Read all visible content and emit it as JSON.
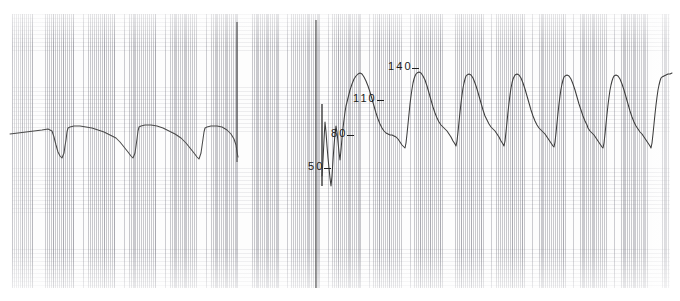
{
  "recording": {
    "kind": "arterial-pressure-strip-chart",
    "units": "mmHg",
    "paper_color": "#fdfdfd",
    "grid_color": "#78788a",
    "trace_color": "#3a3a3a",
    "label_color": "#1b1b1b"
  },
  "scale": {
    "labels": [
      {
        "value": "140",
        "y": 68
      },
      {
        "value": "110",
        "y": 100
      },
      {
        "value": "80",
        "y": 135
      },
      {
        "value": "50",
        "y": 168
      }
    ]
  },
  "chart_data": {
    "type": "line",
    "title": "",
    "subtitle": "",
    "xlabel": "",
    "ylabel": "mmHg",
    "ylim": [
      20,
      160
    ],
    "xlim": [
      0,
      680
    ],
    "grid": true,
    "legend": false,
    "annotations": [
      "140-",
      "110-",
      "80-",
      "50-"
    ],
    "tick_values": [
      50,
      80,
      110,
      140
    ],
    "tick_pixel_y": [
      168,
      135,
      100,
      68
    ],
    "markers": [
      {
        "name": "transition-line",
        "x": 237,
        "y0": 22,
        "y1": 162
      },
      {
        "name": "recalibration-line",
        "x": 316,
        "y0": 20,
        "y1": 288
      },
      {
        "name": "calibration-spike",
        "x": 322,
        "y0": 104,
        "y1": 186
      }
    ],
    "series": [
      {
        "name": "damped-arterial-trace",
        "x_range": [
          10,
          238
        ],
        "mean_pressure": 75,
        "systolic_est": 84,
        "diastolic_est": 66,
        "points": [
          [
            10,
            134
          ],
          [
            18,
            133
          ],
          [
            26,
            132
          ],
          [
            34,
            131
          ],
          [
            42,
            130
          ],
          [
            48,
            129
          ],
          [
            52,
            131
          ],
          [
            54,
            137
          ],
          [
            56,
            145
          ],
          [
            58,
            152
          ],
          [
            60,
            156
          ],
          [
            62,
            158
          ],
          [
            64,
            153
          ],
          [
            65,
            146
          ],
          [
            66,
            140
          ],
          [
            67,
            132
          ],
          [
            68,
            128
          ],
          [
            70,
            127
          ],
          [
            74,
            126
          ],
          [
            80,
            126
          ],
          [
            86,
            127
          ],
          [
            92,
            128
          ],
          [
            98,
            130
          ],
          [
            104,
            132
          ],
          [
            110,
            135
          ],
          [
            116,
            138
          ],
          [
            120,
            142
          ],
          [
            124,
            147
          ],
          [
            128,
            152
          ],
          [
            131,
            156
          ],
          [
            133,
            158
          ],
          [
            135,
            153
          ],
          [
            136,
            146
          ],
          [
            137,
            139
          ],
          [
            138,
            131
          ],
          [
            139,
            127
          ],
          [
            141,
            126
          ],
          [
            145,
            125
          ],
          [
            151,
            125
          ],
          [
            157,
            126
          ],
          [
            163,
            128
          ],
          [
            169,
            131
          ],
          [
            175,
            134
          ],
          [
            181,
            138
          ],
          [
            186,
            143
          ],
          [
            190,
            148
          ],
          [
            194,
            153
          ],
          [
            197,
            157
          ],
          [
            199,
            159
          ],
          [
            201,
            153
          ],
          [
            202,
            146
          ],
          [
            203,
            139
          ],
          [
            204,
            132
          ],
          [
            205,
            128
          ],
          [
            207,
            127
          ],
          [
            211,
            126
          ],
          [
            217,
            126
          ],
          [
            222,
            127
          ],
          [
            227,
            130
          ],
          [
            231,
            134
          ],
          [
            234,
            139
          ],
          [
            236,
            145
          ],
          [
            237,
            152
          ],
          [
            238,
            157
          ]
        ]
      },
      {
        "name": "arterial-pressure-trace",
        "x_range": [
          322,
          672
        ],
        "systolic_est": 136,
        "diastolic_est": 72,
        "beats": 8,
        "points": [
          [
            322,
            176
          ],
          [
            323,
            160
          ],
          [
            324,
            140
          ],
          [
            325,
            122
          ],
          [
            326,
            132
          ],
          [
            327,
            146
          ],
          [
            328,
            158
          ],
          [
            329,
            168
          ],
          [
            330,
            178
          ],
          [
            331,
            186
          ],
          [
            332,
            176
          ],
          [
            333,
            160
          ],
          [
            334,
            146
          ],
          [
            335,
            134
          ],
          [
            336,
            126
          ],
          [
            337,
            132
          ],
          [
            338,
            142
          ],
          [
            339,
            152
          ],
          [
            340,
            160
          ],
          [
            341,
            150
          ],
          [
            342,
            138
          ],
          [
            343,
            128
          ],
          [
            344,
            120
          ],
          [
            345,
            112
          ],
          [
            346,
            106
          ],
          [
            348,
            98
          ],
          [
            350,
            90
          ],
          [
            352,
            84
          ],
          [
            354,
            79
          ],
          [
            356,
            76
          ],
          [
            358,
            74
          ],
          [
            360,
            73
          ],
          [
            362,
            74
          ],
          [
            364,
            77
          ],
          [
            366,
            81
          ],
          [
            368,
            86
          ],
          [
            370,
            92
          ],
          [
            372,
            99
          ],
          [
            374,
            106
          ],
          [
            376,
            113
          ],
          [
            378,
            119
          ],
          [
            380,
            124
          ],
          [
            382,
            128
          ],
          [
            384,
            131
          ],
          [
            386,
            133
          ],
          [
            388,
            134
          ],
          [
            390,
            135
          ],
          [
            392,
            135
          ],
          [
            394,
            136
          ],
          [
            396,
            137
          ],
          [
            398,
            139
          ],
          [
            400,
            142
          ],
          [
            402,
            145
          ],
          [
            404,
            147
          ],
          [
            405,
            148
          ],
          [
            406,
            143
          ],
          [
            407,
            134
          ],
          [
            408,
            124
          ],
          [
            409,
            114
          ],
          [
            410,
            104
          ],
          [
            411,
            96
          ],
          [
            412,
            89
          ],
          [
            413,
            83
          ],
          [
            414,
            79
          ],
          [
            415,
            76
          ],
          [
            416,
            74
          ],
          [
            417,
            73
          ],
          [
            419,
            72
          ],
          [
            421,
            73
          ],
          [
            423,
            76
          ],
          [
            425,
            80
          ],
          [
            427,
            86
          ],
          [
            429,
            93
          ],
          [
            431,
            100
          ],
          [
            433,
            107
          ],
          [
            435,
            113
          ],
          [
            437,
            118
          ],
          [
            439,
            122
          ],
          [
            441,
            125
          ],
          [
            443,
            127
          ],
          [
            445,
            129
          ],
          [
            447,
            131
          ],
          [
            449,
            134
          ],
          [
            451,
            137
          ],
          [
            453,
            141
          ],
          [
            455,
            144
          ],
          [
            456,
            146
          ],
          [
            457,
            141
          ],
          [
            458,
            132
          ],
          [
            459,
            122
          ],
          [
            460,
            112
          ],
          [
            461,
            103
          ],
          [
            462,
            95
          ],
          [
            463,
            88
          ],
          [
            464,
            83
          ],
          [
            465,
            79
          ],
          [
            466,
            76
          ],
          [
            467,
            75
          ],
          [
            469,
            74
          ],
          [
            471,
            75
          ],
          [
            473,
            78
          ],
          [
            475,
            83
          ],
          [
            477,
            89
          ],
          [
            479,
            96
          ],
          [
            481,
            103
          ],
          [
            483,
            110
          ],
          [
            485,
            116
          ],
          [
            487,
            120
          ],
          [
            489,
            124
          ],
          [
            491,
            127
          ],
          [
            493,
            129
          ],
          [
            495,
            131
          ],
          [
            497,
            134
          ],
          [
            499,
            137
          ],
          [
            501,
            141
          ],
          [
            503,
            144
          ],
          [
            504,
            146
          ],
          [
            505,
            141
          ],
          [
            506,
            132
          ],
          [
            507,
            122
          ],
          [
            508,
            112
          ],
          [
            509,
            103
          ],
          [
            510,
            95
          ],
          [
            511,
            88
          ],
          [
            512,
            83
          ],
          [
            513,
            79
          ],
          [
            514,
            77
          ],
          [
            515,
            75
          ],
          [
            517,
            74
          ],
          [
            519,
            75
          ],
          [
            521,
            78
          ],
          [
            523,
            83
          ],
          [
            525,
            89
          ],
          [
            527,
            96
          ],
          [
            529,
            103
          ],
          [
            531,
            110
          ],
          [
            533,
            116
          ],
          [
            535,
            121
          ],
          [
            537,
            125
          ],
          [
            539,
            128
          ],
          [
            541,
            130
          ],
          [
            543,
            132
          ],
          [
            545,
            134
          ],
          [
            547,
            137
          ],
          [
            549,
            140
          ],
          [
            551,
            143
          ],
          [
            553,
            146
          ],
          [
            554,
            147
          ],
          [
            555,
            142
          ],
          [
            556,
            133
          ],
          [
            557,
            123
          ],
          [
            558,
            113
          ],
          [
            559,
            104
          ],
          [
            560,
            96
          ],
          [
            561,
            89
          ],
          [
            562,
            84
          ],
          [
            563,
            80
          ],
          [
            564,
            77
          ],
          [
            565,
            76
          ],
          [
            567,
            75
          ],
          [
            569,
            76
          ],
          [
            571,
            79
          ],
          [
            573,
            84
          ],
          [
            575,
            90
          ],
          [
            577,
            97
          ],
          [
            579,
            104
          ],
          [
            581,
            110
          ],
          [
            583,
            116
          ],
          [
            585,
            121
          ],
          [
            587,
            125
          ],
          [
            588,
            128
          ],
          [
            590,
            131
          ],
          [
            592,
            133
          ],
          [
            594,
            135
          ],
          [
            596,
            138
          ],
          [
            598,
            141
          ],
          [
            600,
            144
          ],
          [
            602,
            147
          ],
          [
            603,
            148
          ],
          [
            604,
            143
          ],
          [
            605,
            134
          ],
          [
            606,
            124
          ],
          [
            607,
            114
          ],
          [
            608,
            105
          ],
          [
            609,
            97
          ],
          [
            610,
            90
          ],
          [
            611,
            85
          ],
          [
            612,
            81
          ],
          [
            613,
            78
          ],
          [
            614,
            76
          ],
          [
            616,
            75
          ],
          [
            618,
            76
          ],
          [
            620,
            79
          ],
          [
            622,
            84
          ],
          [
            624,
            90
          ],
          [
            626,
            97
          ],
          [
            628,
            104
          ],
          [
            630,
            111
          ],
          [
            632,
            117
          ],
          [
            634,
            122
          ],
          [
            636,
            126
          ],
          [
            638,
            129
          ],
          [
            640,
            132
          ],
          [
            642,
            134
          ],
          [
            644,
            137
          ],
          [
            646,
            140
          ],
          [
            648,
            143
          ],
          [
            650,
            146
          ],
          [
            651,
            148
          ],
          [
            652,
            143
          ],
          [
            653,
            134
          ],
          [
            654,
            124
          ],
          [
            655,
            114
          ],
          [
            656,
            105
          ],
          [
            657,
            97
          ],
          [
            658,
            90
          ],
          [
            659,
            85
          ],
          [
            660,
            81
          ],
          [
            661,
            78
          ],
          [
            662,
            77
          ],
          [
            664,
            76
          ],
          [
            666,
            75
          ],
          [
            668,
            74
          ],
          [
            670,
            74
          ],
          [
            672,
            73
          ]
        ]
      }
    ]
  }
}
